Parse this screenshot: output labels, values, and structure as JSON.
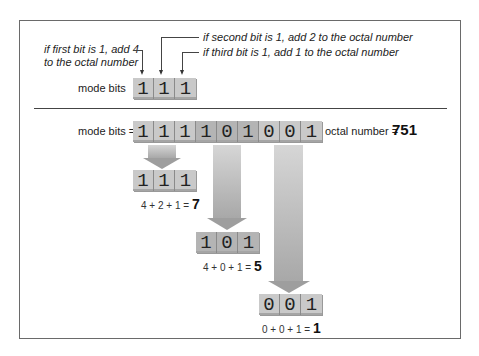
{
  "annotations": {
    "first_bit": [
      "if first bit is 1, add 4",
      "to the octal number"
    ],
    "second_bit": "if second bit is 1, add 2 to the octal number",
    "third_bit": "if third bit is 1, add 1 to the octal number"
  },
  "top_example": {
    "label": "mode bits",
    "bits": [
      "1",
      "1",
      "1"
    ]
  },
  "main": {
    "label": "mode bits =",
    "bits": [
      "1",
      "1",
      "1",
      "1",
      "0",
      "1",
      "0",
      "0",
      "1"
    ],
    "octal_label": "octal number =",
    "octal_value": "751"
  },
  "groups": [
    {
      "bits": [
        "1",
        "1",
        "1"
      ],
      "equation": "4 + 2 + 1 =",
      "result": "7"
    },
    {
      "bits": [
        "1",
        "0",
        "1"
      ],
      "equation": "4 + 0 + 1 =",
      "result": "5"
    },
    {
      "bits": [
        "0",
        "0",
        "1"
      ],
      "equation": "0 + 0 + 1 =",
      "result": "1"
    }
  ],
  "colors": {
    "cell": "#c9c9c9",
    "cell_dark": "#b4b4b4",
    "arrow": "#a8a8a8",
    "border": "#6a6a6a"
  }
}
